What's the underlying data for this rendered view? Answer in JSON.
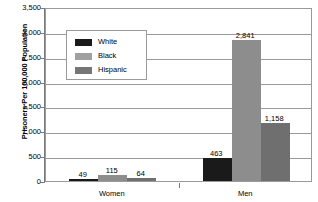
{
  "chart_data": {
    "type": "bar",
    "title": "",
    "xlabel": "",
    "ylabel": "Prisoners Per 100,000 Population",
    "categories": [
      "Women",
      "Men"
    ],
    "ylim": [
      0,
      3500
    ],
    "yticks": [
      "0",
      "500",
      "1,000",
      "1,500",
      "2,000",
      "2,500",
      "3,000",
      "3,500"
    ],
    "ytick_values": [
      0,
      500,
      1000,
      1500,
      2000,
      2500,
      3000,
      3500
    ],
    "grid": true,
    "legend_position": "upper-left-inside",
    "series": [
      {
        "name": "White",
        "color": "#1a1a1a",
        "values": [
          49,
          463
        ],
        "labels": [
          "49",
          "463"
        ]
      },
      {
        "name": "Black",
        "color": "#8d8d8d",
        "values": [
          115,
          2841
        ],
        "labels": [
          "115",
          "2,841"
        ]
      },
      {
        "name": "Hispanic",
        "color": "#6f6f6f",
        "values": [
          64,
          1158
        ],
        "labels": [
          "64",
          "1,158"
        ]
      }
    ]
  },
  "legend": {
    "items": [
      {
        "label": "White"
      },
      {
        "label": "Black"
      },
      {
        "label": "Hispanic"
      }
    ]
  }
}
